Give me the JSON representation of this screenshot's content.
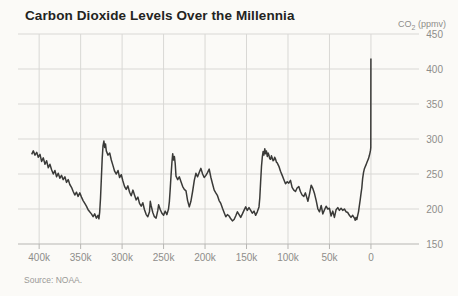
{
  "header": {
    "title": "Carbon Dioxide Levels Over the Millennia"
  },
  "axis_unit": {
    "prefix": "CO",
    "sub": "2",
    "suffix": " (ppmv)"
  },
  "footer": {
    "source": "Source: NOAA."
  },
  "colors": {
    "line": "#3a3a38",
    "grid": "#d9d8d5",
    "axis": "#b7b6b3",
    "tick_text": "#8e8d8a",
    "title_text": "#232321",
    "background": "#fbfaf7"
  },
  "chart_data": {
    "type": "line",
    "title": "Carbon Dioxide Levels Over the Millennia",
    "xlabel": "",
    "ylabel": "CO2 (ppmv)",
    "source": "Source: NOAA.",
    "grid": "on",
    "legend": "none",
    "x_unit": "thousands of years before present",
    "xlim": [
      425.5,
      -49.5
    ],
    "ylim": [
      150,
      450
    ],
    "x_ticks": [
      {
        "value": 400,
        "label": "400k"
      },
      {
        "value": 350,
        "label": "350k"
      },
      {
        "value": 300,
        "label": "300k"
      },
      {
        "value": 250,
        "label": "250k"
      },
      {
        "value": 200,
        "label": "200k"
      },
      {
        "value": 150,
        "label": "150k"
      },
      {
        "value": 100,
        "label": "100k"
      },
      {
        "value": 50,
        "label": "50k"
      },
      {
        "value": 0,
        "label": "0"
      }
    ],
    "y_ticks": [
      {
        "value": 450,
        "label": "450"
      },
      {
        "value": 400,
        "label": "400"
      },
      {
        "value": 350,
        "label": "350"
      },
      {
        "value": 300,
        "label": "300"
      },
      {
        "value": 250,
        "label": "250"
      },
      {
        "value": 200,
        "label": "200"
      },
      {
        "value": 150,
        "label": "150"
      }
    ],
    "series": [
      {
        "name": "CO2 (ppmv)",
        "points": [
          [
            409,
            278
          ],
          [
            407,
            283
          ],
          [
            405,
            277
          ],
          [
            403,
            281
          ],
          [
            401,
            274
          ],
          [
            399,
            278
          ],
          [
            397,
            268
          ],
          [
            395,
            273
          ],
          [
            393,
            264
          ],
          [
            391,
            269
          ],
          [
            389,
            259
          ],
          [
            387,
            264
          ],
          [
            385,
            256
          ],
          [
            383,
            250
          ],
          [
            381,
            255
          ],
          [
            379,
            246
          ],
          [
            377,
            251
          ],
          [
            375,
            244
          ],
          [
            373,
            248
          ],
          [
            371,
            242
          ],
          [
            369,
            246
          ],
          [
            367,
            238
          ],
          [
            365,
            242
          ],
          [
            363,
            235
          ],
          [
            361,
            231
          ],
          [
            359,
            225
          ],
          [
            357,
            220
          ],
          [
            355,
            224
          ],
          [
            353,
            218
          ],
          [
            351,
            223
          ],
          [
            349,
            217
          ],
          [
            347,
            212
          ],
          [
            345,
            208
          ],
          [
            343,
            204
          ],
          [
            341,
            199
          ],
          [
            339,
            196
          ],
          [
            337,
            193
          ],
          [
            335,
            189
          ],
          [
            333,
            193
          ],
          [
            331,
            187
          ],
          [
            329,
            191
          ],
          [
            328,
            186
          ],
          [
            327,
            196
          ],
          [
            326,
            215
          ],
          [
            325,
            245
          ],
          [
            324,
            272
          ],
          [
            323,
            290
          ],
          [
            322,
            297
          ],
          [
            321,
            288
          ],
          [
            320,
            293
          ],
          [
            319,
            283
          ],
          [
            317,
            277
          ],
          [
            315,
            280
          ],
          [
            313,
            270
          ],
          [
            311,
            262
          ],
          [
            309,
            254
          ],
          [
            307,
            250
          ],
          [
            305,
            255
          ],
          [
            303,
            245
          ],
          [
            301,
            249
          ],
          [
            299,
            240
          ],
          [
            297,
            232
          ],
          [
            295,
            228
          ],
          [
            293,
            233
          ],
          [
            291,
            224
          ],
          [
            289,
            219
          ],
          [
            287,
            227
          ],
          [
            285,
            220
          ],
          [
            283,
            213
          ],
          [
            281,
            217
          ],
          [
            279,
            208
          ],
          [
            277,
            204
          ],
          [
            275,
            209
          ],
          [
            273,
            199
          ],
          [
            271,
            192
          ],
          [
            269,
            189
          ],
          [
            267,
            196
          ],
          [
            266,
            211
          ],
          [
            265,
            205
          ],
          [
            263,
            195
          ],
          [
            261,
            189
          ],
          [
            259,
            187
          ],
          [
            257,
            198
          ],
          [
            256,
            206
          ],
          [
            254,
            199
          ],
          [
            252,
            194
          ],
          [
            250,
            191
          ],
          [
            248,
            197
          ],
          [
            246,
            192
          ],
          [
            244,
            200
          ],
          [
            243,
            211
          ],
          [
            242,
            228
          ],
          [
            241,
            247
          ],
          [
            240,
            266
          ],
          [
            239,
            279
          ],
          [
            238,
            270
          ],
          [
            237,
            275
          ],
          [
            236,
            265
          ],
          [
            235,
            247
          ],
          [
            233,
            242
          ],
          [
            231,
            246
          ],
          [
            229,
            239
          ],
          [
            227,
            232
          ],
          [
            225,
            228
          ],
          [
            223,
            226
          ],
          [
            221,
            212
          ],
          [
            219,
            203
          ],
          [
            217,
            211
          ],
          [
            215,
            225
          ],
          [
            213,
            241
          ],
          [
            211,
            251
          ],
          [
            209,
            246
          ],
          [
            207,
            252
          ],
          [
            205,
            258
          ],
          [
            203,
            250
          ],
          [
            201,
            245
          ],
          [
            199,
            248
          ],
          [
            197,
            252
          ],
          [
            195,
            257
          ],
          [
            193,
            245
          ],
          [
            191,
            236
          ],
          [
            189,
            227
          ],
          [
            187,
            223
          ],
          [
            185,
            219
          ],
          [
            183,
            212
          ],
          [
            181,
            208
          ],
          [
            179,
            201
          ],
          [
            177,
            195
          ],
          [
            175,
            189
          ],
          [
            173,
            192
          ],
          [
            171,
            190
          ],
          [
            169,
            186
          ],
          [
            167,
            183
          ],
          [
            165,
            185
          ],
          [
            163,
            190
          ],
          [
            161,
            196
          ],
          [
            159,
            192
          ],
          [
            157,
            188
          ],
          [
            155,
            193
          ],
          [
            153,
            198
          ],
          [
            151,
            203
          ],
          [
            149,
            198
          ],
          [
            147,
            202
          ],
          [
            145,
            198
          ],
          [
            143,
            194
          ],
          [
            141,
            197
          ],
          [
            139,
            191
          ],
          [
            137,
            196
          ],
          [
            135,
            203
          ],
          [
            134,
            216
          ],
          [
            133,
            238
          ],
          [
            132,
            261
          ],
          [
            131,
            274
          ],
          [
            130,
            282
          ],
          [
            129,
            277
          ],
          [
            128,
            286
          ],
          [
            127,
            279
          ],
          [
            126,
            283
          ],
          [
            125,
            275
          ],
          [
            124,
            280
          ],
          [
            123,
            277
          ],
          [
            122,
            272
          ],
          [
            121,
            271
          ],
          [
            120,
            276
          ],
          [
            119,
            273
          ],
          [
            118,
            269
          ],
          [
            117,
            270
          ],
          [
            116,
            274
          ],
          [
            115,
            271
          ],
          [
            114,
            267
          ],
          [
            113,
            266
          ],
          [
            111,
            261
          ],
          [
            109,
            254
          ],
          [
            107,
            248
          ],
          [
            105,
            242
          ],
          [
            103,
            236
          ],
          [
            101,
            239
          ],
          [
            99,
            237
          ],
          [
            97,
            241
          ],
          [
            95,
            231
          ],
          [
            93,
            227
          ],
          [
            91,
            225
          ],
          [
            89,
            230
          ],
          [
            87,
            232
          ],
          [
            85,
            225
          ],
          [
            83,
            220
          ],
          [
            81,
            218
          ],
          [
            79,
            223
          ],
          [
            77,
            215
          ],
          [
            76,
            211
          ],
          [
            74,
            222
          ],
          [
            72,
            234
          ],
          [
            70,
            229
          ],
          [
            68,
            222
          ],
          [
            66,
            212
          ],
          [
            64,
            200
          ],
          [
            62,
            196
          ],
          [
            60,
            205
          ],
          [
            58,
            193
          ],
          [
            56,
            199
          ],
          [
            54,
            204
          ],
          [
            52,
            200
          ],
          [
            50,
            201
          ],
          [
            48,
            190
          ],
          [
            46,
            197
          ],
          [
            44,
            188
          ],
          [
            42,
            199
          ],
          [
            40,
            202
          ],
          [
            38,
            198
          ],
          [
            36,
            201
          ],
          [
            34,
            198
          ],
          [
            32,
            200
          ],
          [
            30,
            196
          ],
          [
            28,
            195
          ],
          [
            26,
            191
          ],
          [
            24,
            188
          ],
          [
            22,
            191
          ],
          [
            20,
            187
          ],
          [
            19,
            184
          ],
          [
            18,
            188
          ],
          [
            17,
            185
          ],
          [
            16,
            191
          ],
          [
            15,
            196
          ],
          [
            14,
            204
          ],
          [
            13,
            213
          ],
          [
            12,
            222
          ],
          [
            11,
            230
          ],
          [
            10,
            243
          ],
          [
            9,
            252
          ],
          [
            8,
            257
          ],
          [
            7,
            260
          ],
          [
            6,
            263
          ],
          [
            5,
            266
          ],
          [
            4,
            269
          ],
          [
            3,
            272
          ],
          [
            2,
            276
          ],
          [
            1,
            281
          ],
          [
            0.5,
            284
          ],
          [
            0.2,
            288
          ],
          [
            0,
            415
          ]
        ]
      }
    ]
  }
}
